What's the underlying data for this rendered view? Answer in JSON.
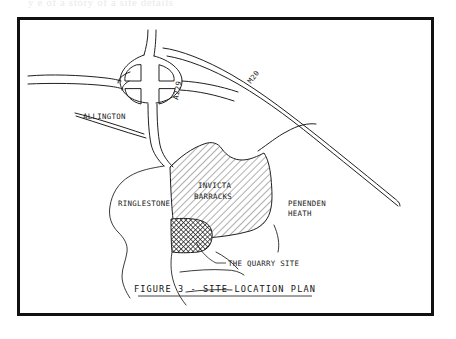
{
  "page": {
    "background_color": "#ffffff",
    "top_text_fragment": "y     e   of  a  story of a    site details"
  },
  "figure": {
    "frame_color": "#111111",
    "title": "FIGURE 3 - SITE LOCATION PLAN",
    "title_underlined": true
  },
  "map": {
    "type": "site-location-plan",
    "ink_color": "#202020",
    "labels": [
      {
        "id": "allington",
        "text": "ALLINGTON",
        "kind": "place",
        "x": 63,
        "y": 99,
        "rotation": 0
      },
      {
        "id": "ringlestone",
        "text": "RINGLESTONE",
        "kind": "place",
        "x": 98,
        "y": 186,
        "rotation": 0
      },
      {
        "id": "penenden-heath-line1",
        "text": "PENENDEN",
        "kind": "place",
        "x": 268,
        "y": 186,
        "rotation": 0
      },
      {
        "id": "penenden-heath-line2",
        "text": "HEATH",
        "kind": "place",
        "x": 268,
        "y": 196,
        "rotation": 0
      },
      {
        "id": "invicta-barracks-line1",
        "text": "INVICTA",
        "kind": "site",
        "x": 178,
        "y": 168,
        "rotation": 0
      },
      {
        "id": "invicta-barracks-line2",
        "text": "BARRACKS",
        "kind": "site",
        "x": 174,
        "y": 179,
        "rotation": 0
      },
      {
        "id": "the-quarry-site",
        "text": "THE QUARRY SITE",
        "kind": "callout",
        "x": 203,
        "y": 229,
        "rotation": 0
      },
      {
        "id": "a229",
        "text": "A229",
        "kind": "road",
        "x": 158,
        "y": 80,
        "rotation": -80
      },
      {
        "id": "m20",
        "text": "M20",
        "kind": "road",
        "x": 231,
        "y": 64,
        "rotation": -52
      }
    ],
    "features": [
      {
        "id": "m20-motorway",
        "name": "M20",
        "kind": "motorway"
      },
      {
        "id": "a229-road",
        "name": "A229",
        "kind": "a-road"
      },
      {
        "id": "roundabout-interchange",
        "name": "Interchange",
        "kind": "junction"
      },
      {
        "id": "invicta-barracks-area",
        "name": "Invicta Barracks",
        "kind": "hatched-area",
        "fill": "diagonal-hatch"
      },
      {
        "id": "quarry-site-area",
        "name": "The Quarry Site",
        "kind": "hatched-area",
        "fill": "cross-hatch"
      }
    ]
  }
}
